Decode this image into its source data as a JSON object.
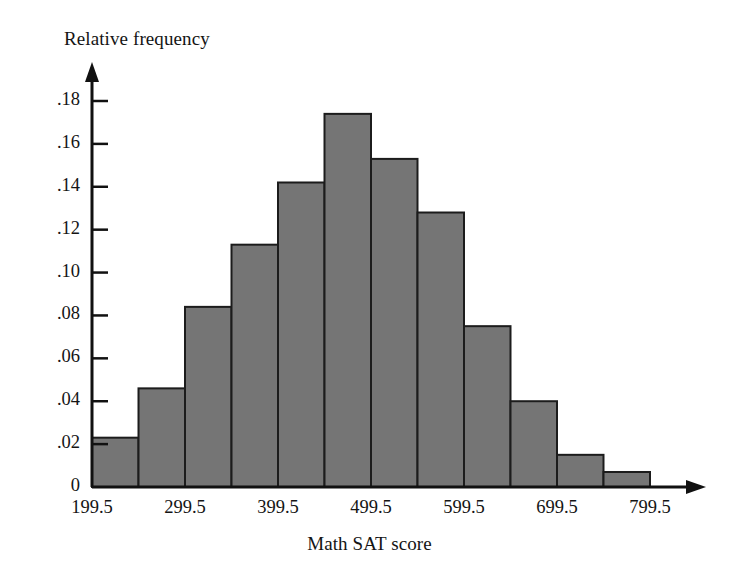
{
  "chart_data": {
    "type": "bar",
    "title": "",
    "subtitle": "",
    "xlabel": "Math SAT score",
    "ylabel": "Relative frequency",
    "grid": false,
    "legend": "none",
    "bin_width": 50,
    "bin_edges": [
      199.5,
      249.5,
      299.5,
      349.5,
      399.5,
      449.5,
      499.5,
      549.5,
      599.5,
      649.5,
      699.5,
      749.5,
      799.5
    ],
    "categories": [
      "199.5-249.5",
      "249.5-299.5",
      "299.5-349.5",
      "349.5-399.5",
      "399.5-449.5",
      "449.5-499.5",
      "499.5-549.5",
      "549.5-599.5",
      "599.5-649.5",
      "649.5-699.5",
      "699.5-749.5",
      "749.5-799.5"
    ],
    "values": [
      0.023,
      0.046,
      0.084,
      0.113,
      0.142,
      0.174,
      0.153,
      0.128,
      0.075,
      0.04,
      0.015,
      0.007
    ],
    "xlim": [
      199.5,
      799.5
    ],
    "ylim": [
      0,
      0.19
    ],
    "xticks": [
      199.5,
      299.5,
      399.5,
      499.5,
      599.5,
      699.5,
      799.5
    ],
    "xtick_labels": [
      "199.5",
      "299.5",
      "399.5",
      "499.5",
      "599.5",
      "699.5",
      "799.5"
    ],
    "yticks": [
      0,
      0.02,
      0.04,
      0.06,
      0.08,
      0.1,
      0.12,
      0.14,
      0.16,
      0.18
    ],
    "ytick_labels": [
      "0",
      ".02",
      ".04",
      ".06",
      ".08",
      ".10",
      ".12",
      ".14",
      ".16",
      ".18"
    ],
    "colors": {
      "bar_fill": "#757575",
      "bar_edge": "#1c1c1c",
      "axis": "#111111",
      "text": "#141414",
      "background": "#ffffff"
    }
  }
}
